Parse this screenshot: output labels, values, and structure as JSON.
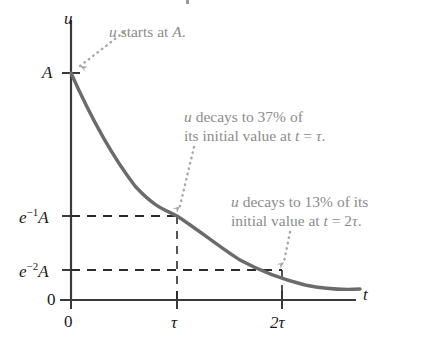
{
  "chart_data": {
    "type": "line",
    "title": "",
    "subtitle": "",
    "xlabel": "t",
    "ylabel": "u",
    "grid": false,
    "legend": "none",
    "xlim": [
      0,
      3.2
    ],
    "ylim": [
      0,
      1.15
    ],
    "x_ticks": [
      {
        "value": 0,
        "label": "0"
      },
      {
        "value": 1,
        "label": "τ"
      },
      {
        "value": 2,
        "label": "2τ"
      }
    ],
    "y_ticks": [
      {
        "value": 0,
        "label": "0",
        "label_parts": {
          "base": "0",
          "exponent": "",
          "suffix": ""
        }
      },
      {
        "value": 0.1353,
        "label": "e−2A",
        "label_parts": {
          "base": "e",
          "exponent": "−2",
          "suffix": "A"
        }
      },
      {
        "value": 0.3679,
        "label": "e−1A",
        "label_parts": {
          "base": "e",
          "exponent": "−1",
          "suffix": "A"
        }
      },
      {
        "value": 1.0,
        "label": "A",
        "label_parts": {
          "base": "A",
          "exponent": "",
          "suffix": ""
        }
      }
    ],
    "series": [
      {
        "name": "u",
        "equation": "u = A e^(-t/τ)",
        "x": [
          0,
          0.1,
          0.2,
          0.3,
          0.4,
          0.5,
          0.6,
          0.7,
          0.8,
          0.9,
          1.0,
          1.2,
          1.4,
          1.6,
          1.8,
          2.0,
          2.2,
          2.4,
          2.6,
          2.8,
          3.0
        ],
        "y": [
          1.0,
          0.905,
          0.819,
          0.741,
          0.67,
          0.607,
          0.549,
          0.497,
          0.449,
          0.407,
          0.368,
          0.301,
          0.247,
          0.202,
          0.165,
          0.135,
          0.111,
          0.091,
          0.074,
          0.061,
          0.05
        ],
        "color": "#6b6b6b"
      }
    ],
    "guide_lines": [
      {
        "name": "e1-horizontal",
        "orientation": "horizontal",
        "y": 0.3679,
        "from_x": 0,
        "to_x": 1.0,
        "style": "dashed"
      },
      {
        "name": "e1-vertical",
        "orientation": "vertical",
        "x": 1.0,
        "from_y": 0,
        "to_y": 0.3679,
        "style": "dashed"
      },
      {
        "name": "e2-horizontal",
        "orientation": "horizontal",
        "y": 0.1353,
        "from_x": 0,
        "to_x": 2.0,
        "style": "dashed"
      },
      {
        "name": "e2-vertical",
        "orientation": "vertical",
        "x": 2.0,
        "from_y": 0,
        "to_y": 0.1353,
        "style": "dashed"
      }
    ],
    "annotations": [
      {
        "id": "start",
        "lines": [
          "u starts at A."
        ],
        "target_x": 0,
        "target_y": 1.0,
        "color": "#8c8c8c"
      },
      {
        "id": "tau",
        "lines": [
          "u decays to 37% of",
          "its initial value at t = τ."
        ],
        "target_x": 1.0,
        "target_y": 0.3679,
        "color": "#8c8c8c"
      },
      {
        "id": "two-tau",
        "lines": [
          "u decays to 13% of its",
          "initial value at t = 2τ."
        ],
        "target_x": 2.0,
        "target_y": 0.1353,
        "color": "#8c8c8c"
      }
    ]
  },
  "axes": {
    "y_axis_label": "u",
    "x_axis_label": "t",
    "origin_label": "0"
  },
  "y_tick_labels": {
    "top": {
      "text": "A"
    },
    "e1": {
      "base": "e",
      "exponent": "−1",
      "suffix": "A"
    },
    "e2": {
      "base": "e",
      "exponent": "−2",
      "suffix": "A"
    },
    "zero": {
      "text": "0"
    }
  },
  "x_tick_labels": {
    "zero": "0",
    "tau": "τ",
    "two_tau": "2τ"
  },
  "annotations": {
    "start": {
      "line1": "u starts at A."
    },
    "tau": {
      "line1": "u decays to 37% of",
      "line2": "its initial value at t = τ."
    },
    "two_tau": {
      "line1": "u decays to 13% of its",
      "line2": "initial value at t = 2τ."
    }
  },
  "colors": {
    "curve": "#6b6b6b",
    "axis": "#3a3a3a",
    "annotation": "#8c8c8c",
    "dashed": "#2b2b2b",
    "background": "#ffffff"
  }
}
